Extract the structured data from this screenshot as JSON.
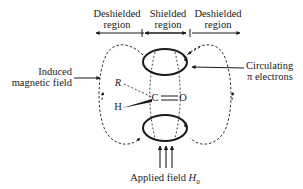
{
  "regions": [
    {
      "line1": "Deshielded",
      "line2": "region"
    },
    {
      "line1": "Shielded",
      "line2": "region"
    },
    {
      "line1": "Deshielded",
      "line2": "region"
    }
  ],
  "labels": {
    "induced_line1": "Induced",
    "induced_line2": "magnetic field",
    "circulating_line1": "Circulating",
    "circulating_line2": "π electrons",
    "applied_field": "Applied field ",
    "applied_symbol": "H",
    "applied_subscript": "0"
  },
  "molecule": {
    "carbon": "C",
    "oxygen": "O",
    "r_group": "R",
    "hydrogen": "H"
  }
}
